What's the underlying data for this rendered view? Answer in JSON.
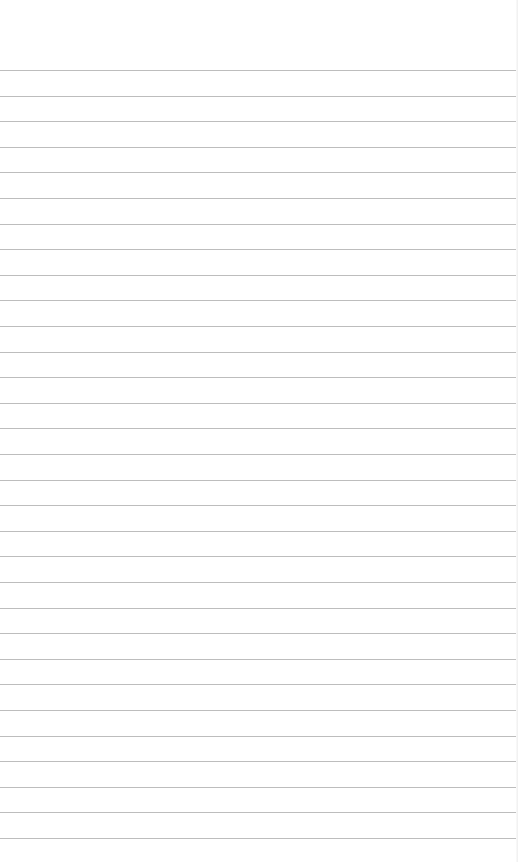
{
  "page": {
    "type": "lined-paper",
    "background_color": "#ffffff",
    "rule_color": "#bdbdbd",
    "first_rule_y": 70,
    "rule_spacing": 25.6,
    "rule_count": 31,
    "text": ""
  }
}
